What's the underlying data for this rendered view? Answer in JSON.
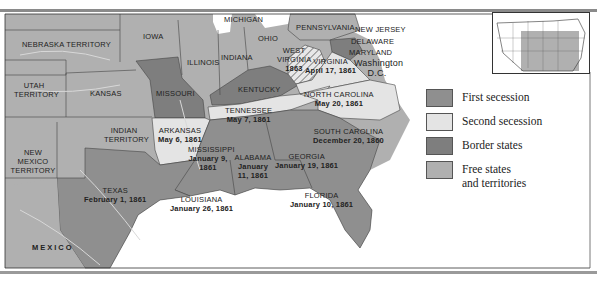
{
  "map": {
    "title": "Secession of Southern States",
    "colors": {
      "first_secession": "#8f8f8f",
      "second_secession": "#e4e4e4",
      "border_states": "#7e7e7e",
      "free_states": "#b0b0b0",
      "water": "#ffffff",
      "rivers": "#d8d8d8"
    },
    "regions": {
      "nebraska": {
        "name": "NEBRASKA TERRITORY"
      },
      "iowa": {
        "name": "IOWA"
      },
      "michigan": {
        "name": "MICHIGAN"
      },
      "pennsylvania": {
        "name": "PENNSYLVANIA"
      },
      "new_jersey": {
        "name": "NEW JERSEY"
      },
      "delaware": {
        "name": "DELAWARE"
      },
      "maryland": {
        "name": "MARYLAND"
      },
      "washington": {
        "name": "Washington D.C."
      },
      "ohio": {
        "name": "OHIO"
      },
      "illinois": {
        "name": "ILLINOIS"
      },
      "indiana": {
        "name": "INDIANA"
      },
      "west_virginia": {
        "name": "WEST VIRGINIA",
        "date": "1863"
      },
      "virginia": {
        "name": "VIRGINIA",
        "date": "April 17, 1861"
      },
      "utah": {
        "name": "UTAH TERRITORY"
      },
      "kansas": {
        "name": "KANSAS"
      },
      "missouri": {
        "name": "MISSOURI"
      },
      "kentucky": {
        "name": "KENTUCKY"
      },
      "tennessee": {
        "name": "TENNESSEE",
        "date": "May 7, 1861"
      },
      "north_carolina": {
        "name": "NORTH CAROLINA",
        "date": "May 20, 1861"
      },
      "arkansas": {
        "name": "ARKANSAS",
        "date": "May 6, 1861"
      },
      "indian_territory": {
        "name": "INDIAN TERRITORY"
      },
      "new_mexico": {
        "name": "NEW MEXICO TERRITORY"
      },
      "south_carolina": {
        "name": "SOUTH CAROLINA",
        "date": "December 20, 1860"
      },
      "mississippi": {
        "name": "MISSISSIPPI",
        "date": "January 9, 1861"
      },
      "alabama": {
        "name": "ALABAMA",
        "date": "January 11, 1861"
      },
      "georgia": {
        "name": "GEORGIA",
        "date": "January 19, 1861"
      },
      "texas": {
        "name": "TEXAS",
        "date": "February 1, 1861"
      },
      "louisiana": {
        "name": "LOUISIANA",
        "date": "January 26, 1861"
      },
      "florida": {
        "name": "FLORIDA",
        "date": "January 10, 1861"
      },
      "mexico": {
        "name": "MEXICO"
      }
    }
  },
  "legend": {
    "items": [
      {
        "label": "First secession",
        "color": "#8f8f8f"
      },
      {
        "label": "Second secession",
        "color": "#e4e4e4"
      },
      {
        "label": "Border states",
        "color": "#7e7e7e"
      },
      {
        "label": "Free states",
        "label2": "and territories",
        "color": "#b0b0b0"
      }
    ]
  },
  "inset": {
    "name": "US locator map"
  }
}
